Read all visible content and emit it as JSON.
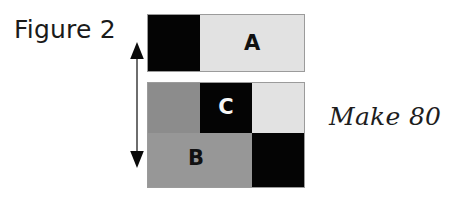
{
  "figure": {
    "caption": "Figure 2",
    "annotation": "Make 80",
    "dimension_arrow": {
      "icon": "double-headed-vertical-arrow",
      "label": ""
    },
    "top_bar": {
      "name": "top-bar",
      "segments": [
        {
          "label": "",
          "fill": "#040404",
          "shade": "black"
        },
        {
          "label": "A",
          "fill": "#e2e2e2",
          "shade": "light-gray"
        }
      ]
    },
    "bottom_block": {
      "name": "bottom-block",
      "upper_row": [
        {
          "label": "",
          "fill": "#8c8c8c",
          "shade": "gray"
        },
        {
          "label": "C",
          "fill": "#040404",
          "shade": "black"
        },
        {
          "label": "",
          "fill": "#e2e2e2",
          "shade": "light-gray"
        }
      ],
      "lower_row": [
        {
          "label": "B",
          "fill": "#979797",
          "shade": "gray"
        },
        {
          "label": "",
          "fill": "#040404",
          "shade": "black"
        }
      ]
    }
  },
  "colors": {
    "black": "#040404",
    "light_gray": "#e2e2e2",
    "gray": "#8c8c8c",
    "gray_alt": "#979797",
    "outline": "#9b9b9b",
    "text": "#1a1a1a"
  }
}
